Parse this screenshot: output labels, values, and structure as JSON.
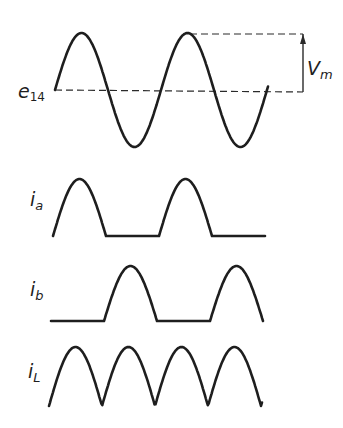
{
  "diagram": {
    "type": "full-wave rectifier waveforms",
    "colors": {
      "stroke": "#1e1e1e",
      "background": "#ffffff"
    },
    "labels": {
      "e14_main": "e",
      "e14_sub": "14",
      "vm_main": "V",
      "vm_sub": "m",
      "ia_main": "i",
      "ia_sub": "a",
      "ib_main": "i",
      "ib_sub": "b",
      "iL_main": "i",
      "iL_sub": "L"
    },
    "traces": [
      {
        "name": "e14",
        "kind": "sine",
        "x0": 55,
        "x1": 268,
        "baseline": 90,
        "amplitude": 57,
        "period": 106
      },
      {
        "name": "ia",
        "kind": "half-wave-positive",
        "x0": 53,
        "x1": 265,
        "baseline": 236,
        "amplitude": 57,
        "period": 106
      },
      {
        "name": "ib",
        "kind": "half-wave-negative",
        "x0": 51,
        "x1": 263,
        "baseline": 321,
        "amplitude": 55,
        "period": 106
      },
      {
        "name": "iL",
        "kind": "full-wave",
        "x0": 49,
        "x1": 262,
        "baseline": 406,
        "amplitude": 59,
        "period": 106
      }
    ],
    "vm_indicator": {
      "top_y": 34,
      "baseline_y": 92,
      "x": 303,
      "peak_x": 190
    }
  }
}
